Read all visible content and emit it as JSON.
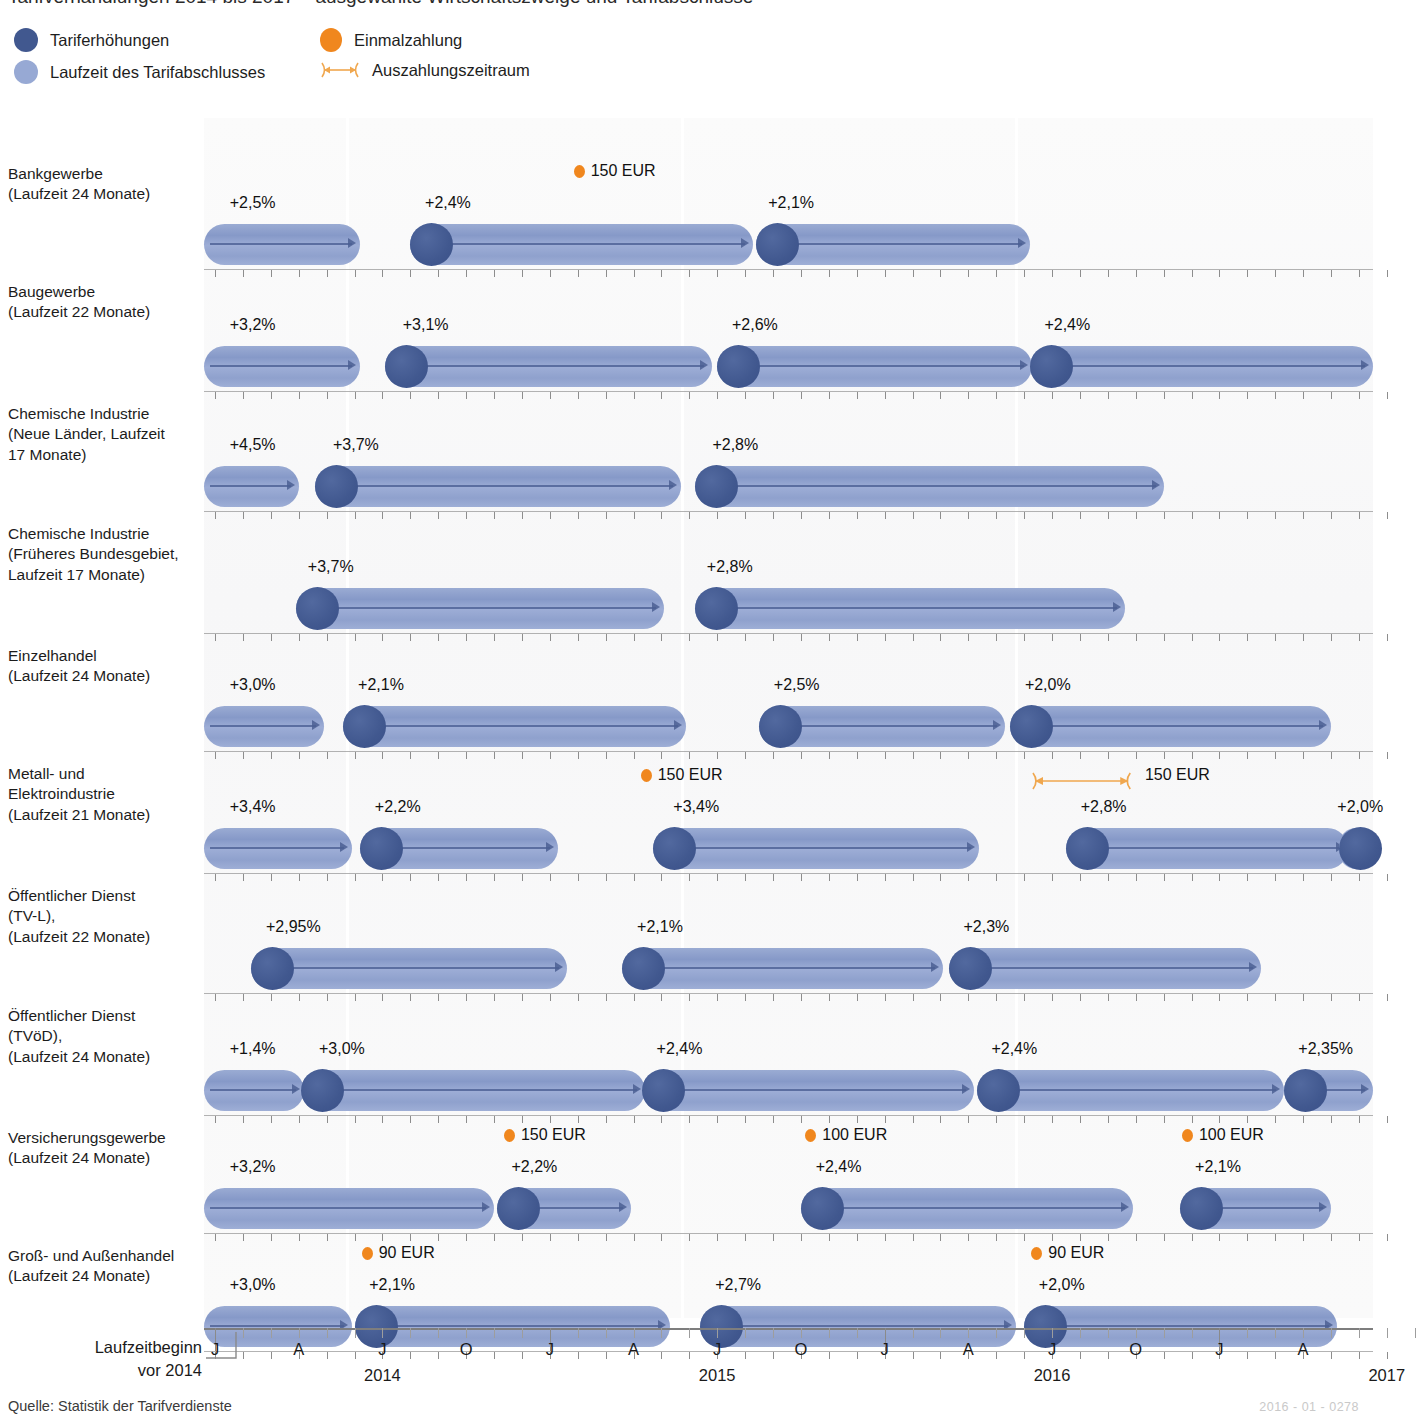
{
  "title_partial": "Tarifverhandlungen 2014 bis 2017 – ausgewählte Wirtschaftszweige und Tarifabschlüsse",
  "legend": {
    "items": [
      {
        "key": "tariferhoehungen",
        "label": "Tariferhöhungen",
        "icon": "dark-blue-dot-icon",
        "color": "#41588f"
      },
      {
        "key": "laufzeit",
        "label": "Laufzeit des Tarifabschlusses",
        "icon": "light-blue-dot-icon",
        "color": "#97a9d4"
      },
      {
        "key": "einmalzahlung",
        "label": "Einmalzahlung",
        "icon": "orange-dot-icon",
        "color": "#f0871e"
      },
      {
        "key": "auszahlungszeitraum",
        "label": "Auszahlungszeitraum",
        "icon": "double-arrow-icon",
        "color": "#f0a74e"
      }
    ]
  },
  "axis": {
    "pre_label_line1": "Laufzeitbeginn",
    "pre_label_line2": "vor 2014",
    "month_ticks": [
      "J",
      "A",
      "J",
      "O",
      "J",
      "A",
      "J",
      "O",
      "J",
      "A",
      "J",
      "O",
      "J",
      "A"
    ],
    "year_labels": [
      "2014",
      "2015",
      "2016",
      "2017"
    ],
    "start_month_index": 0,
    "end_month_index": 43,
    "px_per_month": 27.9,
    "origin_px": 215
  },
  "footer": {
    "source": "Quelle: Statistik der Tarifverdienste",
    "image_code": "2016 - 01 - 0278"
  },
  "chart_data": {
    "type": "bar",
    "title": "Tarifverhandlungen 2014 bis 2017 – ausgewählte Wirtschaftszweige und Tarifabschlüsse",
    "xlabel": "",
    "ylabel": "",
    "grid": false,
    "legend_position": "top-left",
    "x_axis": {
      "unit": "month",
      "range": [
        "2014-01",
        "2017-08"
      ],
      "major_ticks": [
        "2014-01",
        "2014-04",
        "2014-07",
        "2014-10",
        "2015-01",
        "2015-04",
        "2015-07",
        "2015-10",
        "2016-01",
        "2016-04",
        "2016-07",
        "2016-10",
        "2017-01",
        "2017-04"
      ],
      "major_tick_labels": [
        "J",
        "A",
        "J",
        "O",
        "J",
        "A",
        "J",
        "O",
        "J",
        "A",
        "J",
        "O",
        "J",
        "A"
      ],
      "year_marks": [
        "2014",
        "2015",
        "2016",
        "2017"
      ]
    },
    "categories": [
      "Bankgewerbe (Laufzeit 24 Monate)",
      "Baugewerbe (Laufzeit 22 Monate)",
      "Chemische Industrie (Neue Länder, Laufzeit 17 Monate)",
      "Chemische Industrie (Früheres Bundesgebiet, Laufzeit 17 Monate)",
      "Einzelhandel (Laufzeit 24 Monate)",
      "Metall- und Elektroindustrie (Laufzeit 21 Monate)",
      "Öffentlicher Dienst (TV-L), (Laufzeit 22 Monate)",
      "Öffentlicher Dienst (TVöD), (Laufzeit 24 Monate)",
      "Versicherungsgewerbe (Laufzeit 24 Monate)",
      "Groß- und Außenhandel (Laufzeit 24 Monate)"
    ],
    "rows": [
      {
        "id": "bankgewerbe",
        "label_lines": [
          "Bankgewerbe",
          "(Laufzeit 24 Monate)"
        ],
        "duration_months": 24,
        "top": 40,
        "height": 118,
        "segments": [
          {
            "start_m": -0.5,
            "end_m": 5.2,
            "knob": false,
            "pct": "+2,5%",
            "pct_at_m": 0.6
          },
          {
            "start_m": 7.0,
            "end_m": 19.3,
            "knob": true,
            "pct": "+2,4%",
            "pct_at_m": 7.6
          },
          {
            "start_m": 19.4,
            "end_m": 29.2,
            "knob": true,
            "pct": "+2,1%",
            "pct_at_m": 19.9
          }
        ],
        "one_time_payments": [
          {
            "amount": "150 EUR",
            "at_m": 13.0,
            "range": null
          }
        ]
      },
      {
        "id": "baugewerbe",
        "label_lines": [
          "Baugewerbe",
          "(Laufzeit 22 Monate)"
        ],
        "duration_months": 22,
        "top": 158,
        "height": 122,
        "segments": [
          {
            "start_m": -0.5,
            "end_m": 5.2,
            "knob": false,
            "pct": "+3,2%",
            "pct_at_m": 0.6
          },
          {
            "start_m": 6.1,
            "end_m": 17.8,
            "knob": true,
            "pct": "+3,1%",
            "pct_at_m": 6.8
          },
          {
            "start_m": 18.0,
            "end_m": 29.3,
            "knob": true,
            "pct": "+2,6%",
            "pct_at_m": 18.6
          },
          {
            "start_m": 29.2,
            "end_m": 43.5,
            "knob": true,
            "pct": "+2,4%",
            "pct_at_m": 29.8
          }
        ],
        "one_time_payments": []
      },
      {
        "id": "chemie-neue-laender",
        "label_lines": [
          "Chemische Industrie",
          "(Neue Länder, Laufzeit",
          "17 Monate)"
        ],
        "duration_months": 17,
        "top": 280,
        "height": 120,
        "segments": [
          {
            "start_m": -0.5,
            "end_m": 3.0,
            "knob": false,
            "pct": "+4,5%",
            "pct_at_m": 0.6
          },
          {
            "start_m": 3.6,
            "end_m": 16.7,
            "knob": true,
            "pct": "+3,7%",
            "pct_at_m": 4.3
          },
          {
            "start_m": 17.2,
            "end_m": 34.0,
            "knob": true,
            "pct": "+2,8%",
            "pct_at_m": 17.9
          }
        ],
        "one_time_payments": []
      },
      {
        "id": "chemie-frueheres-bundesgebiet",
        "label_lines": [
          "Chemische Industrie",
          "(Früheres Bundesgebiet,",
          "Laufzeit 17 Monate)"
        ],
        "duration_months": 17,
        "top": 400,
        "height": 122,
        "segments": [
          {
            "start_m": 2.9,
            "end_m": 16.1,
            "knob": true,
            "pct": "+3,7%",
            "pct_at_m": 3.4
          },
          {
            "start_m": 17.2,
            "end_m": 32.6,
            "knob": true,
            "pct": "+2,8%",
            "pct_at_m": 17.7
          }
        ],
        "one_time_payments": []
      },
      {
        "id": "einzelhandel",
        "label_lines": [
          "Einzelhandel",
          "(Laufzeit 24 Monate)"
        ],
        "duration_months": 24,
        "top": 522,
        "height": 118,
        "segments": [
          {
            "start_m": -0.5,
            "end_m": 3.9,
            "knob": false,
            "pct": "+3,0%",
            "pct_at_m": 0.6
          },
          {
            "start_m": 4.6,
            "end_m": 16.9,
            "knob": true,
            "pct": "+2,1%",
            "pct_at_m": 5.2
          },
          {
            "start_m": 19.5,
            "end_m": 28.3,
            "knob": true,
            "pct": "+2,5%",
            "pct_at_m": 20.1
          },
          {
            "start_m": 28.5,
            "end_m": 40.0,
            "knob": true,
            "pct": "+2,0%",
            "pct_at_m": 29.1
          }
        ],
        "one_time_payments": []
      },
      {
        "id": "metall-elektro",
        "label_lines": [
          "Metall- und",
          "Elektroindustrie",
          "(Laufzeit 21 Monate)"
        ],
        "duration_months": 21,
        "top": 640,
        "height": 122,
        "segments": [
          {
            "start_m": -0.5,
            "end_m": 4.9,
            "knob": false,
            "pct": "+3,4%",
            "pct_at_m": 0.6
          },
          {
            "start_m": 5.2,
            "end_m": 12.3,
            "knob": true,
            "pct": "+2,2%",
            "pct_at_m": 5.8
          },
          {
            "start_m": 15.7,
            "end_m": 27.4,
            "knob": true,
            "pct": "+3,4%",
            "pct_at_m": 16.5
          },
          {
            "start_m": 30.5,
            "end_m": 40.6,
            "knob": true,
            "pct": "+2,8%",
            "pct_at_m": 31.1
          },
          {
            "start_m": 40.3,
            "end_m": 42.3,
            "knob": true,
            "pct": "+2,0%",
            "pct_at_m": 40.3
          }
        ],
        "one_time_payments": [
          {
            "amount": "150 EUR",
            "at_m": 15.4,
            "range": null
          },
          {
            "amount": "150 EUR",
            "at_m": 31.0,
            "range": [
              29.2,
              32.9
            ]
          }
        ]
      },
      {
        "id": "oed-tvl",
        "label_lines": [
          "Öffentlicher Dienst",
          "(TV-L),",
          "(Laufzeit 22 Monate)"
        ],
        "duration_months": 22,
        "top": 762,
        "height": 120,
        "segments": [
          {
            "start_m": 1.3,
            "end_m": 12.6,
            "knob": true,
            "pct": "+2,95%",
            "pct_at_m": 1.9
          },
          {
            "start_m": 14.6,
            "end_m": 26.1,
            "knob": true,
            "pct": "+2,1%",
            "pct_at_m": 15.2
          },
          {
            "start_m": 26.3,
            "end_m": 37.5,
            "knob": true,
            "pct": "+2,3%",
            "pct_at_m": 26.9
          }
        ],
        "one_time_payments": []
      },
      {
        "id": "oed-tvoed",
        "label_lines": [
          "Öffentlicher Dienst",
          "(TVöD),",
          "(Laufzeit 24 Monate)"
        ],
        "duration_months": 24,
        "top": 882,
        "height": 122,
        "segments": [
          {
            "start_m": -0.5,
            "end_m": 3.2,
            "knob": false,
            "pct": "+1,4%",
            "pct_at_m": 0.6
          },
          {
            "start_m": 3.1,
            "end_m": 15.4,
            "knob": true,
            "pct": "+3,0%",
            "pct_at_m": 3.8
          },
          {
            "start_m": 15.3,
            "end_m": 27.2,
            "knob": true,
            "pct": "+2,4%",
            "pct_at_m": 15.9
          },
          {
            "start_m": 27.3,
            "end_m": 38.3,
            "knob": true,
            "pct": "+2,4%",
            "pct_at_m": 27.9
          },
          {
            "start_m": 38.3,
            "end_m": 43.0,
            "knob": true,
            "pct": "+2,35%",
            "pct_at_m": 38.9
          }
        ],
        "one_time_payments": []
      },
      {
        "id": "versicherungsgewerbe",
        "label_lines": [
          "Versicherungsgewerbe",
          "(Laufzeit 24 Monate)"
        ],
        "duration_months": 24,
        "top": 1004,
        "height": 118,
        "segments": [
          {
            "start_m": -0.5,
            "end_m": 10.0,
            "knob": false,
            "pct": "+3,2%",
            "pct_at_m": 0.6
          },
          {
            "start_m": 10.1,
            "end_m": 14.9,
            "knob": true,
            "pct": "+2,2%",
            "pct_at_m": 10.7
          },
          {
            "start_m": 21.0,
            "end_m": 32.9,
            "knob": true,
            "pct": "+2,4%",
            "pct_at_m": 21.6
          },
          {
            "start_m": 34.6,
            "end_m": 40.0,
            "knob": true,
            "pct": "+2,1%",
            "pct_at_m": 35.2
          }
        ],
        "one_time_payments": [
          {
            "amount": "150 EUR",
            "at_m": 10.5,
            "range": null
          },
          {
            "amount": "100 EUR",
            "at_m": 21.3,
            "range": null
          },
          {
            "amount": "100 EUR",
            "at_m": 34.8,
            "range": null
          }
        ]
      },
      {
        "id": "gross-aussenhandel",
        "label_lines": [
          "Groß- und Außenhandel",
          "(Laufzeit 24 Monate)"
        ],
        "duration_months": 24,
        "top": 1122,
        "height": 118,
        "segments": [
          {
            "start_m": -0.5,
            "end_m": 4.9,
            "knob": false,
            "pct": "+3,0%",
            "pct_at_m": 0.6
          },
          {
            "start_m": 5.0,
            "end_m": 16.3,
            "knob": true,
            "pct": "+2,1%",
            "pct_at_m": 5.6
          },
          {
            "start_m": 17.4,
            "end_m": 28.7,
            "knob": true,
            "pct": "+2,7%",
            "pct_at_m": 18.0
          },
          {
            "start_m": 29.0,
            "end_m": 40.2,
            "knob": true,
            "pct": "+2,0%",
            "pct_at_m": 29.6
          }
        ],
        "one_time_payments": [
          {
            "amount": "90 EUR",
            "at_m": 5.4,
            "range": null
          },
          {
            "amount": "90 EUR",
            "at_m": 29.4,
            "range": null
          }
        ]
      }
    ]
  }
}
